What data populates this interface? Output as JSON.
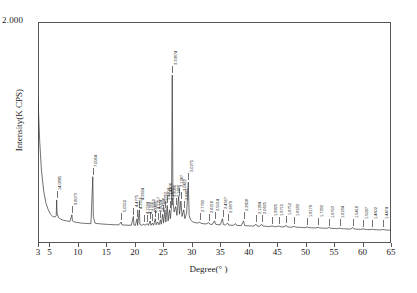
{
  "chart_data": {
    "type": "line",
    "title": "",
    "xlabel": "Degree(° )",
    "ylabel": "Intensity(K CPS)",
    "xlim": [
      3,
      65
    ],
    "ylim": [
      0,
      2.0
    ],
    "y_max_label": "2.000",
    "grid": false,
    "legend": null,
    "xticks": [
      3,
      5,
      10,
      15,
      20,
      25,
      30,
      35,
      40,
      45,
      50,
      55,
      60,
      65
    ],
    "xtick_labels": [
      "3",
      "5",
      "10",
      "15",
      "20",
      "25",
      "30",
      "35",
      "40",
      "45",
      "50",
      "55",
      "60",
      "65"
    ],
    "series": [
      {
        "name": "XRD pattern",
        "color": "#333333",
        "points": [
          [
            3.0,
            1.3
          ],
          [
            3.3,
            0.92
          ],
          [
            3.6,
            0.66
          ],
          [
            4.0,
            0.47
          ],
          [
            4.4,
            0.36
          ],
          [
            4.8,
            0.3
          ],
          [
            5.2,
            0.26
          ],
          [
            5.6,
            0.24
          ],
          [
            6.0,
            0.235
          ],
          [
            6.2,
            0.245
          ],
          [
            6.28,
            0.39
          ],
          [
            6.35,
            0.27
          ],
          [
            6.6,
            0.23
          ],
          [
            7.0,
            0.215
          ],
          [
            7.5,
            0.205
          ],
          [
            8.0,
            0.2
          ],
          [
            8.6,
            0.195
          ],
          [
            8.95,
            0.255
          ],
          [
            9.05,
            0.2
          ],
          [
            9.4,
            0.19
          ],
          [
            10.0,
            0.185
          ],
          [
            10.6,
            0.18
          ],
          [
            11.2,
            0.178
          ],
          [
            11.8,
            0.176
          ],
          [
            12.3,
            0.175
          ],
          [
            12.55,
            0.5
          ],
          [
            12.62,
            0.6
          ],
          [
            12.72,
            0.24
          ],
          [
            13.0,
            0.18
          ],
          [
            13.6,
            0.175
          ],
          [
            14.2,
            0.172
          ],
          [
            14.8,
            0.17
          ],
          [
            15.4,
            0.168
          ],
          [
            16.0,
            0.166
          ],
          [
            16.6,
            0.165
          ],
          [
            17.2,
            0.164
          ],
          [
            17.6,
            0.19
          ],
          [
            17.75,
            0.165
          ],
          [
            18.2,
            0.162
          ],
          [
            18.8,
            0.161
          ],
          [
            19.4,
            0.16
          ],
          [
            19.75,
            0.24
          ],
          [
            19.85,
            0.163
          ],
          [
            20.1,
            0.16
          ],
          [
            20.4,
            0.22
          ],
          [
            20.5,
            0.16
          ],
          [
            20.8,
            0.3
          ],
          [
            20.9,
            0.17
          ],
          [
            21.2,
            0.16
          ],
          [
            21.6,
            0.17
          ],
          [
            21.8,
            0.16
          ],
          [
            22.2,
            0.175
          ],
          [
            22.4,
            0.16
          ],
          [
            22.7,
            0.2
          ],
          [
            22.85,
            0.16
          ],
          [
            23.1,
            0.18
          ],
          [
            23.3,
            0.16
          ],
          [
            23.6,
            0.22
          ],
          [
            23.75,
            0.165
          ],
          [
            24.0,
            0.19
          ],
          [
            24.25,
            0.165
          ],
          [
            24.5,
            0.21
          ],
          [
            24.65,
            0.17
          ],
          [
            24.9,
            0.26
          ],
          [
            25.05,
            0.18
          ],
          [
            25.3,
            0.3
          ],
          [
            25.45,
            0.19
          ],
          [
            25.7,
            0.34
          ],
          [
            25.85,
            0.2
          ],
          [
            26.1,
            0.3
          ],
          [
            26.25,
            0.22
          ],
          [
            26.45,
            0.33
          ],
          [
            26.58,
            1.52
          ],
          [
            26.7,
            0.4
          ],
          [
            26.9,
            0.28
          ],
          [
            27.2,
            0.33
          ],
          [
            27.4,
            0.25
          ],
          [
            27.7,
            0.42
          ],
          [
            27.85,
            0.26
          ],
          [
            28.1,
            0.38
          ],
          [
            28.3,
            0.24
          ],
          [
            28.6,
            0.3
          ],
          [
            28.8,
            0.22
          ],
          [
            29.1,
            0.27
          ],
          [
            29.4,
            0.55
          ],
          [
            29.55,
            0.25
          ],
          [
            29.8,
            0.21
          ],
          [
            30.2,
            0.19
          ],
          [
            30.6,
            0.185
          ],
          [
            31.0,
            0.18
          ],
          [
            31.4,
            0.19
          ],
          [
            31.6,
            0.178
          ],
          [
            32.0,
            0.175
          ],
          [
            32.5,
            0.172
          ],
          [
            33.0,
            0.185
          ],
          [
            33.2,
            0.17
          ],
          [
            33.6,
            0.168
          ],
          [
            34.0,
            0.2
          ],
          [
            34.2,
            0.17
          ],
          [
            34.6,
            0.166
          ],
          [
            35.0,
            0.164
          ],
          [
            35.4,
            0.22
          ],
          [
            35.55,
            0.168
          ],
          [
            35.9,
            0.163
          ],
          [
            36.3,
            0.18
          ],
          [
            36.5,
            0.162
          ],
          [
            36.9,
            0.161
          ],
          [
            37.3,
            0.16
          ],
          [
            37.7,
            0.175
          ],
          [
            37.9,
            0.159
          ],
          [
            38.3,
            0.158
          ],
          [
            38.7,
            0.157
          ],
          [
            39.1,
            0.2
          ],
          [
            39.3,
            0.158
          ],
          [
            39.7,
            0.156
          ],
          [
            40.1,
            0.155
          ],
          [
            40.5,
            0.154
          ],
          [
            40.9,
            0.153
          ],
          [
            41.3,
            0.17
          ],
          [
            41.5,
            0.154
          ],
          [
            41.9,
            0.152
          ],
          [
            42.3,
            0.17
          ],
          [
            42.5,
            0.153
          ],
          [
            42.9,
            0.151
          ],
          [
            43.3,
            0.15
          ],
          [
            43.7,
            0.149
          ],
          [
            44.1,
            0.155
          ],
          [
            44.5,
            0.148
          ],
          [
            44.9,
            0.147
          ],
          [
            45.3,
            0.155
          ],
          [
            45.5,
            0.148
          ],
          [
            45.8,
            0.146
          ],
          [
            46.2,
            0.145
          ],
          [
            46.6,
            0.16
          ],
          [
            46.8,
            0.146
          ],
          [
            47.2,
            0.144
          ],
          [
            47.6,
            0.143
          ],
          [
            48.0,
            0.152
          ],
          [
            48.3,
            0.143
          ],
          [
            48.7,
            0.142
          ],
          [
            49.1,
            0.141
          ],
          [
            49.5,
            0.14
          ],
          [
            49.9,
            0.139
          ],
          [
            50.3,
            0.145
          ],
          [
            50.6,
            0.139
          ],
          [
            51.0,
            0.138
          ],
          [
            51.4,
            0.137
          ],
          [
            51.8,
            0.136
          ],
          [
            52.2,
            0.142
          ],
          [
            52.5,
            0.136
          ],
          [
            52.9,
            0.135
          ],
          [
            53.3,
            0.134
          ],
          [
            53.7,
            0.133
          ],
          [
            54.1,
            0.14
          ],
          [
            54.4,
            0.134
          ],
          [
            54.8,
            0.132
          ],
          [
            55.2,
            0.131
          ],
          [
            55.6,
            0.13
          ],
          [
            56.0,
            0.135
          ],
          [
            56.3,
            0.13
          ],
          [
            56.7,
            0.129
          ],
          [
            57.1,
            0.128
          ],
          [
            57.5,
            0.127
          ],
          [
            57.9,
            0.126
          ],
          [
            58.3,
            0.14
          ],
          [
            58.5,
            0.128
          ],
          [
            58.9,
            0.125
          ],
          [
            59.3,
            0.124
          ],
          [
            59.7,
            0.123
          ],
          [
            60.1,
            0.128
          ],
          [
            60.5,
            0.123
          ],
          [
            60.9,
            0.122
          ],
          [
            61.3,
            0.121
          ],
          [
            61.7,
            0.125
          ],
          [
            62.0,
            0.121
          ],
          [
            62.4,
            0.12
          ],
          [
            62.8,
            0.119
          ],
          [
            63.2,
            0.118
          ],
          [
            63.6,
            0.124
          ],
          [
            63.9,
            0.119
          ],
          [
            64.3,
            0.117
          ],
          [
            64.7,
            0.116
          ],
          [
            65.0,
            0.115
          ]
        ]
      }
    ],
    "peak_labels": [
      {
        "text": "14.0885",
        "two_theta": 6.28,
        "y": 0.39
      },
      {
        "text": "9.8073",
        "two_theta": 8.95,
        "y": 0.255
      },
      {
        "text": "7.0064",
        "two_theta": 12.62,
        "y": 0.6
      },
      {
        "text": "5.0550",
        "two_theta": 17.6,
        "y": 0.19
      },
      {
        "text": "4.4775",
        "two_theta": 19.75,
        "y": 0.24
      },
      {
        "text": "4.3155",
        "two_theta": 20.4,
        "y": 0.22
      },
      {
        "text": "4.2624",
        "two_theta": 20.8,
        "y": 0.3
      },
      {
        "text": "4.1594",
        "two_theta": 21.6,
        "y": 0.17
      },
      {
        "text": "4.1768",
        "two_theta": 22.2,
        "y": 0.175
      },
      {
        "text": "3.9250",
        "two_theta": 22.7,
        "y": 0.2
      },
      {
        "text": "4.2495",
        "two_theta": 23.1,
        "y": 0.18
      },
      {
        "text": "4.1257",
        "two_theta": 23.6,
        "y": 0.22
      },
      {
        "text": "3.8024",
        "two_theta": 24.0,
        "y": 0.19
      },
      {
        "text": "3.7696",
        "two_theta": 24.5,
        "y": 0.21
      },
      {
        "text": "3.5762",
        "two_theta": 24.9,
        "y": 0.26
      },
      {
        "text": "3.4804",
        "two_theta": 25.3,
        "y": 0.3
      },
      {
        "text": "3.4406",
        "two_theta": 25.7,
        "y": 0.34
      },
      {
        "text": "3.3475",
        "two_theta": 26.1,
        "y": 0.3
      },
      {
        "text": "3.2086",
        "two_theta": 26.45,
        "y": 0.33
      },
      {
        "text": "3.33874",
        "two_theta": 26.58,
        "y": 1.52
      },
      {
        "text": "3.1888",
        "two_theta": 27.2,
        "y": 0.33
      },
      {
        "text": "3.1247",
        "two_theta": 27.7,
        "y": 0.42
      },
      {
        "text": "3.0422",
        "two_theta": 28.1,
        "y": 0.38
      },
      {
        "text": "2.8861",
        "two_theta": 28.6,
        "y": 0.3
      },
      {
        "text": "3.0275",
        "two_theta": 29.4,
        "y": 0.55
      },
      {
        "text": "2.7792",
        "two_theta": 31.4,
        "y": 0.19
      },
      {
        "text": "2.6216",
        "two_theta": 33.0,
        "y": 0.185
      },
      {
        "text": "2.5014",
        "two_theta": 34.0,
        "y": 0.2
      },
      {
        "text": "2.4567",
        "two_theta": 35.4,
        "y": 0.22
      },
      {
        "text": "2.3879",
        "two_theta": 36.3,
        "y": 0.18
      },
      {
        "text": "2.2808",
        "two_theta": 39.1,
        "y": 0.2
      },
      {
        "text": "2.1284",
        "two_theta": 41.3,
        "y": 0.17
      },
      {
        "text": "2.0625",
        "two_theta": 42.3,
        "y": 0.17
      },
      {
        "text": "1.9925",
        "two_theta": 44.1,
        "y": 0.155
      },
      {
        "text": "1.9715",
        "two_theta": 45.3,
        "y": 0.155
      },
      {
        "text": "1.8752",
        "two_theta": 46.6,
        "y": 0.16
      },
      {
        "text": "1.8182",
        "two_theta": 48.0,
        "y": 0.152
      },
      {
        "text": "1.8179",
        "two_theta": 50.3,
        "y": 0.145
      },
      {
        "text": "1.7292",
        "two_theta": 52.2,
        "y": 0.142
      },
      {
        "text": "1.6703",
        "two_theta": 54.1,
        "y": 0.14
      },
      {
        "text": "1.6184",
        "two_theta": 56.0,
        "y": 0.135
      },
      {
        "text": "1.5418",
        "two_theta": 58.3,
        "y": 0.14
      },
      {
        "text": "1.5097",
        "two_theta": 60.1,
        "y": 0.128
      },
      {
        "text": "1.4602",
        "two_theta": 61.7,
        "y": 0.125
      },
      {
        "text": "1.4474",
        "two_theta": 63.6,
        "y": 0.124
      }
    ]
  }
}
